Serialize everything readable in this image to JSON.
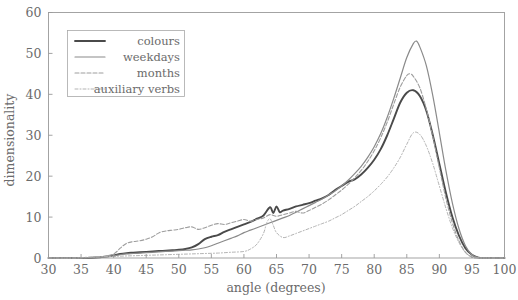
{
  "chart_data": {
    "type": "line",
    "title": "",
    "xlabel": "angle (degrees)",
    "ylabel": "dimensionality",
    "xlim": [
      30,
      100
    ],
    "ylim": [
      0,
      60
    ],
    "xticks": [
      30,
      35,
      40,
      45,
      50,
      55,
      60,
      65,
      70,
      75,
      80,
      85,
      90,
      95,
      100
    ],
    "yticks": [
      0,
      10,
      20,
      30,
      40,
      50,
      60
    ],
    "grid": false,
    "legend_position": "upper-left",
    "series": [
      {
        "name": "colours",
        "color": "#4a4a4a",
        "width": 1.9,
        "dash": "none",
        "peak_x": 86,
        "peak_y": 41,
        "x": [
          30,
          32,
          34,
          36,
          38,
          39,
          40,
          41,
          42,
          43,
          44,
          45,
          46,
          47,
          48,
          49,
          50,
          51,
          52,
          53,
          54,
          55,
          56,
          57,
          58,
          59,
          60,
          61,
          62,
          63,
          64,
          64.5,
          65,
          65.5,
          66,
          67,
          68,
          69,
          70,
          71,
          72,
          73,
          74,
          75,
          76,
          77,
          78,
          79,
          80,
          81,
          82,
          83,
          84,
          85,
          86,
          87,
          88,
          89,
          90,
          91,
          92,
          93,
          94,
          95,
          96,
          97,
          100
        ],
        "y": [
          0,
          0,
          0,
          0,
          0.2,
          0.4,
          0.6,
          1.0,
          1.2,
          1.3,
          1.4,
          1.5,
          1.6,
          1.7,
          1.8,
          1.9,
          2.0,
          2.2,
          2.6,
          3.4,
          4.6,
          5.2,
          5.6,
          6.4,
          7.0,
          7.6,
          8.2,
          8.8,
          9.6,
          10.4,
          12.4,
          11.0,
          12.6,
          11.2,
          11.6,
          12.0,
          12.6,
          13.0,
          13.4,
          14.0,
          14.6,
          15.4,
          16.6,
          17.6,
          18.6,
          19.2,
          20.4,
          22.0,
          24.0,
          26.6,
          30.0,
          34.0,
          38.0,
          40.4,
          41.0,
          39.6,
          36.0,
          30.0,
          23.0,
          16.0,
          10.0,
          5.5,
          2.4,
          0.8,
          0.1,
          0,
          0
        ]
      },
      {
        "name": "weekdays",
        "color": "#8a8a8a",
        "width": 1.2,
        "dash": "none",
        "peak_x": 86.5,
        "peak_y": 53,
        "x": [
          30,
          34,
          38,
          40,
          41,
          42,
          43,
          44,
          45,
          46,
          47,
          48,
          49,
          50,
          51,
          52,
          53,
          54,
          55,
          56,
          57,
          58,
          59,
          60,
          61,
          62,
          63,
          64,
          65,
          66,
          67,
          68,
          69,
          70,
          71,
          72,
          73,
          74,
          75,
          76,
          77,
          78,
          79,
          80,
          81,
          82,
          83,
          84,
          85,
          86,
          86.5,
          87,
          88,
          89,
          90,
          91,
          92,
          93,
          94,
          95,
          96,
          97,
          100
        ],
        "y": [
          0,
          0,
          0.2,
          0.5,
          0.8,
          1.0,
          1.1,
          1.2,
          1.3,
          1.4,
          1.5,
          1.6,
          1.7,
          1.8,
          1.9,
          2.0,
          2.2,
          2.5,
          3.0,
          3.6,
          4.2,
          4.8,
          5.4,
          6.2,
          6.8,
          7.4,
          8.0,
          8.6,
          9.2,
          9.8,
          10.4,
          11.2,
          12.0,
          12.8,
          13.6,
          14.4,
          15.4,
          16.4,
          17.6,
          19.0,
          20.6,
          22.4,
          24.6,
          27.2,
          30.4,
          34.4,
          39.0,
          44.0,
          49.0,
          52.4,
          53.0,
          51.6,
          47.0,
          39.6,
          30.6,
          21.4,
          13.4,
          7.2,
          3.0,
          0.8,
          0.1,
          0,
          0
        ]
      },
      {
        "name": "months",
        "color": "#9d9d9d",
        "width": 1.1,
        "dash": "4,2",
        "peak_x": 85.5,
        "peak_y": 45,
        "x": [
          30,
          34,
          38,
          40,
          41,
          42,
          43,
          44,
          45,
          46,
          47,
          48,
          49,
          50,
          51,
          52,
          53,
          54,
          55,
          56,
          57,
          58,
          59,
          60,
          61,
          62,
          63,
          64,
          65,
          66,
          67,
          68,
          69,
          70,
          71,
          72,
          73,
          74,
          75,
          76,
          77,
          78,
          79,
          80,
          81,
          82,
          83,
          84,
          85,
          85.5,
          86,
          87,
          88,
          89,
          90,
          91,
          92,
          93,
          94,
          95,
          96,
          97,
          100
        ],
        "y": [
          0,
          0,
          0.3,
          1.0,
          2.4,
          3.6,
          4.0,
          4.2,
          4.6,
          5.2,
          6.2,
          6.6,
          6.8,
          7.0,
          7.4,
          7.6,
          7.0,
          7.4,
          8.0,
          8.4,
          8.2,
          8.6,
          9.0,
          9.4,
          9.0,
          9.4,
          9.8,
          10.6,
          10.2,
          10.6,
          11.0,
          11.4,
          11.0,
          11.6,
          12.4,
          13.2,
          14.2,
          15.4,
          16.6,
          18.0,
          19.6,
          21.4,
          23.6,
          26.2,
          29.4,
          33.2,
          37.6,
          41.8,
          44.6,
          45.0,
          44.4,
          41.6,
          36.4,
          29.6,
          22.0,
          14.6,
          8.6,
          4.2,
          1.4,
          0.2,
          0,
          0,
          0
        ]
      },
      {
        "name": "auxiliary verbs",
        "color": "#b3b3b3",
        "width": 1.0,
        "dash": "3,2,1,2",
        "peak_x": 86,
        "peak_y": 31,
        "x": [
          30,
          34,
          36,
          38,
          40,
          42,
          44,
          46,
          48,
          50,
          52,
          54,
          56,
          58,
          60,
          61,
          62,
          63,
          63.5,
          64,
          64.5,
          65,
          66,
          67,
          68,
          69,
          70,
          71,
          72,
          73,
          74,
          75,
          76,
          77,
          78,
          79,
          80,
          81,
          82,
          83,
          84,
          85,
          86,
          87,
          88,
          89,
          90,
          91,
          92,
          93,
          94,
          95,
          96,
          97,
          100
        ],
        "y": [
          0,
          0,
          0.2,
          0.3,
          0.4,
          0.5,
          0.6,
          0.7,
          0.8,
          0.9,
          1.0,
          1.1,
          1.2,
          1.4,
          1.6,
          2.2,
          3.4,
          6.0,
          8.6,
          9.6,
          8.0,
          6.2,
          5.0,
          5.4,
          6.0,
          6.6,
          7.2,
          7.8,
          8.4,
          9.0,
          9.8,
          10.6,
          11.6,
          12.6,
          13.8,
          15.0,
          16.4,
          18.0,
          19.8,
          22.0,
          24.6,
          27.8,
          30.6,
          30.2,
          27.4,
          23.0,
          17.6,
          12.2,
          7.4,
          3.8,
          1.4,
          0.3,
          0,
          0,
          0
        ]
      }
    ]
  },
  "legend": {
    "entries": [
      {
        "label": "colours"
      },
      {
        "label": "weekdays"
      },
      {
        "label": "months"
      },
      {
        "label": "auxiliary verbs"
      }
    ]
  }
}
